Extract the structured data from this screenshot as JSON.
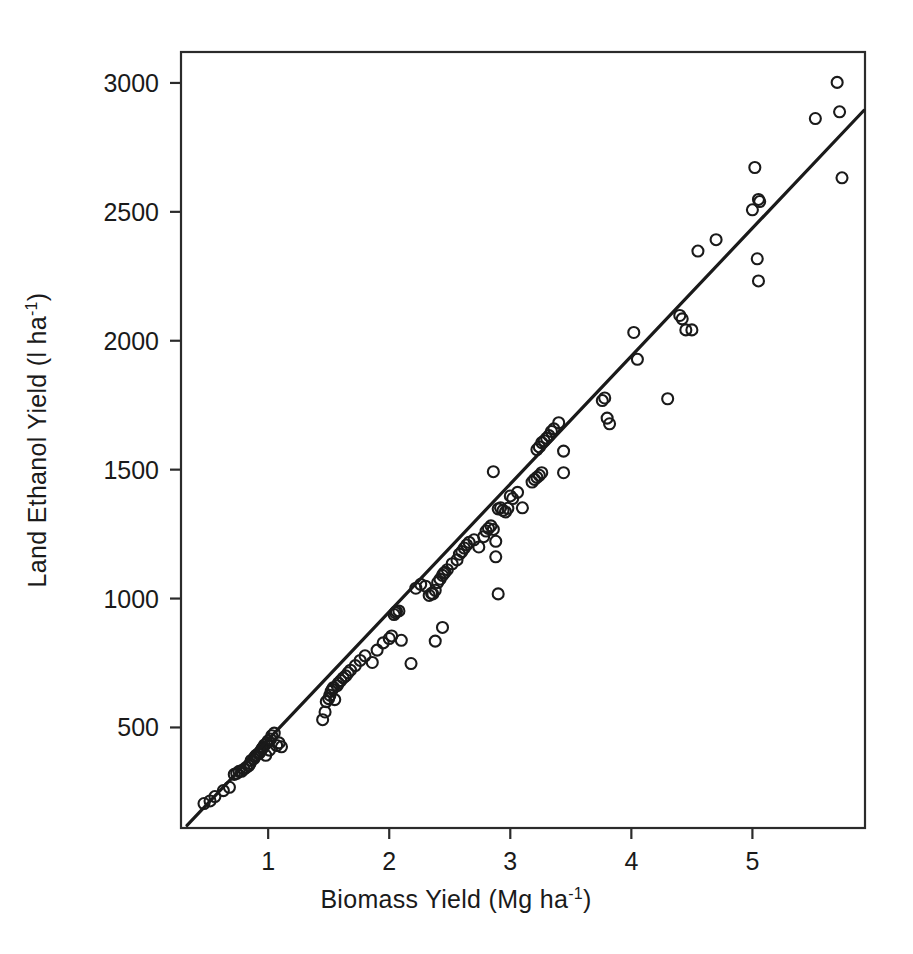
{
  "chart_data": {
    "type": "scatter",
    "title": "",
    "subtitle": "",
    "xlabel": "Biomass Yield  (Mg ha",
    "xlabel_sup": "-1",
    "xlabel_tail": ")",
    "ylabel": "Land Ethanol Yield  (l ha",
    "ylabel_sup": "-1",
    "ylabel_tail": ")",
    "xlim": [
      0.28,
      5.93
    ],
    "ylim": [
      110,
      3120
    ],
    "xticks": [
      1,
      2,
      3,
      4,
      5
    ],
    "xtick_labels": [
      "1",
      "2",
      "3",
      "4",
      "5"
    ],
    "yticks": [
      500,
      1000,
      1500,
      2000,
      2500,
      3000
    ],
    "ytick_labels": [
      "500",
      "1000",
      "1500",
      "2000",
      "2500",
      "3000"
    ],
    "grid": false,
    "legend": "none",
    "marker_style": "open-circle",
    "marker_radius_px": 5.5,
    "series": [
      {
        "name": "Observations",
        "points": [
          [
            0.47,
            205
          ],
          [
            0.52,
            215
          ],
          [
            0.56,
            232
          ],
          [
            0.63,
            255
          ],
          [
            0.68,
            268
          ],
          [
            0.72,
            318
          ],
          [
            0.74,
            322
          ],
          [
            0.76,
            330
          ],
          [
            0.78,
            330
          ],
          [
            0.8,
            338
          ],
          [
            0.82,
            345
          ],
          [
            0.84,
            352
          ],
          [
            0.85,
            360
          ],
          [
            0.86,
            372
          ],
          [
            0.88,
            378
          ],
          [
            0.89,
            386
          ],
          [
            0.9,
            392
          ],
          [
            0.92,
            398
          ],
          [
            0.93,
            402
          ],
          [
            0.94,
            410
          ],
          [
            0.95,
            418
          ],
          [
            0.96,
            424
          ],
          [
            0.97,
            432
          ],
          [
            0.98,
            392
          ],
          [
            0.99,
            440
          ],
          [
            1.0,
            448
          ],
          [
            1.01,
            412
          ],
          [
            1.02,
            455
          ],
          [
            1.03,
            468
          ],
          [
            1.05,
            478
          ],
          [
            1.07,
            430
          ],
          [
            1.09,
            440
          ],
          [
            1.11,
            425
          ],
          [
            1.45,
            530
          ],
          [
            1.47,
            560
          ],
          [
            1.48,
            600
          ],
          [
            1.5,
            612
          ],
          [
            1.51,
            625
          ],
          [
            1.52,
            640
          ],
          [
            1.53,
            648
          ],
          [
            1.54,
            655
          ],
          [
            1.55,
            608
          ],
          [
            1.57,
            662
          ],
          [
            1.58,
            672
          ],
          [
            1.6,
            682
          ],
          [
            1.62,
            692
          ],
          [
            1.64,
            700
          ],
          [
            1.66,
            712
          ],
          [
            1.68,
            722
          ],
          [
            1.72,
            740
          ],
          [
            1.76,
            760
          ],
          [
            1.8,
            778
          ],
          [
            1.86,
            752
          ],
          [
            1.9,
            800
          ],
          [
            1.95,
            828
          ],
          [
            2.0,
            845
          ],
          [
            2.02,
            855
          ],
          [
            2.04,
            938
          ],
          [
            2.05,
            945
          ],
          [
            2.06,
            950
          ],
          [
            2.08,
            952
          ],
          [
            2.1,
            838
          ],
          [
            2.18,
            748
          ],
          [
            2.22,
            1040
          ],
          [
            2.26,
            1055
          ],
          [
            2.3,
            1048
          ],
          [
            2.33,
            1012
          ],
          [
            2.35,
            1020
          ],
          [
            2.36,
            1018
          ],
          [
            2.38,
            1032
          ],
          [
            2.4,
            1062
          ],
          [
            2.42,
            1075
          ],
          [
            2.44,
            1090
          ],
          [
            2.45,
            1098
          ],
          [
            2.46,
            1102
          ],
          [
            2.38,
            835
          ],
          [
            2.44,
            888
          ],
          [
            2.48,
            1112
          ],
          [
            2.52,
            1135
          ],
          [
            2.56,
            1150
          ],
          [
            2.58,
            1172
          ],
          [
            2.6,
            1182
          ],
          [
            2.62,
            1196
          ],
          [
            2.64,
            1208
          ],
          [
            2.66,
            1218
          ],
          [
            2.7,
            1228
          ],
          [
            2.74,
            1200
          ],
          [
            2.78,
            1240
          ],
          [
            2.8,
            1262
          ],
          [
            2.82,
            1272
          ],
          [
            2.84,
            1282
          ],
          [
            2.86,
            1268
          ],
          [
            2.88,
            1222
          ],
          [
            2.88,
            1162
          ],
          [
            2.9,
            1018
          ],
          [
            2.9,
            1348
          ],
          [
            2.92,
            1352
          ],
          [
            2.94,
            1342
          ],
          [
            2.96,
            1336
          ],
          [
            2.98,
            1350
          ],
          [
            2.86,
            1492
          ],
          [
            3.0,
            1398
          ],
          [
            3.02,
            1388
          ],
          [
            3.06,
            1412
          ],
          [
            3.1,
            1352
          ],
          [
            3.18,
            1452
          ],
          [
            3.2,
            1462
          ],
          [
            3.22,
            1470
          ],
          [
            3.24,
            1478
          ],
          [
            3.26,
            1488
          ],
          [
            3.22,
            1578
          ],
          [
            3.24,
            1588
          ],
          [
            3.26,
            1605
          ],
          [
            3.28,
            1612
          ],
          [
            3.3,
            1622
          ],
          [
            3.32,
            1632
          ],
          [
            3.34,
            1648
          ],
          [
            3.36,
            1658
          ],
          [
            3.4,
            1682
          ],
          [
            3.44,
            1572
          ],
          [
            3.44,
            1488
          ],
          [
            3.76,
            1768
          ],
          [
            3.78,
            1778
          ],
          [
            3.8,
            1700
          ],
          [
            3.82,
            1678
          ],
          [
            4.02,
            2032
          ],
          [
            4.05,
            1928
          ],
          [
            4.3,
            1775
          ],
          [
            4.4,
            2098
          ],
          [
            4.42,
            2085
          ],
          [
            4.45,
            2042
          ],
          [
            4.5,
            2042
          ],
          [
            4.55,
            2348
          ],
          [
            4.7,
            2392
          ],
          [
            5.0,
            2508
          ],
          [
            5.02,
            2672
          ],
          [
            5.05,
            2548
          ],
          [
            5.06,
            2540
          ],
          [
            5.04,
            2318
          ],
          [
            5.05,
            2232
          ],
          [
            5.52,
            2862
          ],
          [
            5.7,
            3002
          ],
          [
            5.72,
            2888
          ],
          [
            5.74,
            2632
          ]
        ]
      }
    ],
    "fit_line": {
      "name": "Regression line",
      "x_start": 0.33,
      "y_start": 120,
      "x_end": 5.92,
      "y_end": 2893
    }
  }
}
